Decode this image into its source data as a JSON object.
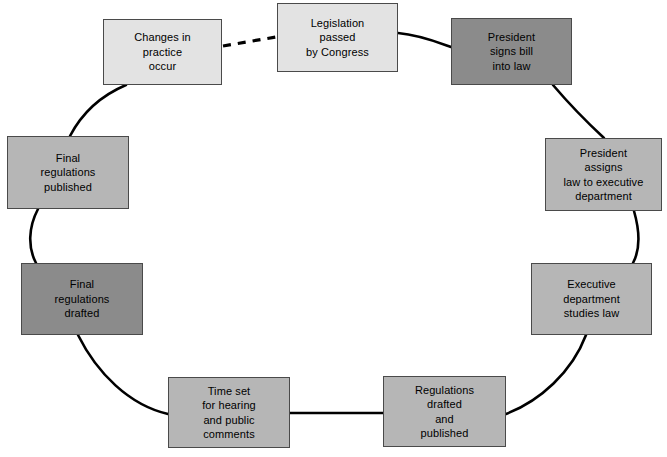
{
  "diagram": {
    "canvas": {
      "width": 667,
      "height": 457,
      "background": "#ffffff"
    },
    "palette": {
      "light": "#e3e3e3",
      "medium": "#b6b6b6",
      "dark": "#8b8b8b",
      "border": "#4a4a4a",
      "edge": "#000000",
      "text": "#000000"
    },
    "nodes": [
      {
        "id": "changes-in-practice-occur",
        "label": "Changes in\npractice\noccur",
        "tone": "light",
        "x": 103,
        "y": 19,
        "w": 119,
        "h": 66
      },
      {
        "id": "legislation-passed-by-congress",
        "label": "Legislation\npassed\nby Congress",
        "tone": "light",
        "x": 277,
        "y": 3,
        "w": 121,
        "h": 69
      },
      {
        "id": "president-signs-bill-into-law",
        "label": "President\nsigns bill\ninto law",
        "tone": "dark",
        "x": 451,
        "y": 18,
        "w": 121,
        "h": 67
      },
      {
        "id": "president-assigns-law-to-executive-department",
        "label": "President\nassigns\nlaw to executive\ndepartment",
        "tone": "medium",
        "x": 545,
        "y": 138,
        "w": 117,
        "h": 73
      },
      {
        "id": "executive-department-studies-law",
        "label": "Executive\ndepartment\nstudies law",
        "tone": "medium",
        "x": 531,
        "y": 263,
        "w": 121,
        "h": 72
      },
      {
        "id": "regulations-drafted-and-published",
        "label": "Regulations\ndrafted\nand\npublished",
        "tone": "medium",
        "x": 383,
        "y": 376,
        "w": 123,
        "h": 71
      },
      {
        "id": "time-set-for-hearing-and-public-comments",
        "label": "Time set\nfor hearing\nand public\ncomments",
        "tone": "medium",
        "x": 168,
        "y": 377,
        "w": 122,
        "h": 71
      },
      {
        "id": "final-regulations-drafted",
        "label": "Final\nregulations\ndrafted",
        "tone": "dark",
        "x": 21,
        "y": 263,
        "w": 122,
        "h": 72
      },
      {
        "id": "final-regulations-published",
        "label": "Final\nregulations\npublished",
        "tone": "medium",
        "x": 7,
        "y": 136,
        "w": 122,
        "h": 73
      }
    ],
    "edges": [
      {
        "id": "edge-changes-to-legislation",
        "from": "changes-in-practice-occur",
        "to": "legislation-passed-by-congress",
        "style": "dashed",
        "path": "M 223 46 L 276 37"
      },
      {
        "id": "edge-legislation-to-president-signs",
        "from": "legislation-passed-by-congress",
        "to": "president-signs-bill-into-law",
        "style": "solid",
        "path": "M 398 33 C 420 35 437 42 451 47"
      },
      {
        "id": "edge-president-signs-to-president-assigns",
        "from": "president-signs-bill-into-law",
        "to": "president-assigns-law-to-executive-department",
        "style": "solid",
        "path": "M 553 85 C 570 105 590 125 604 138"
      },
      {
        "id": "edge-president-assigns-to-executive-studies",
        "from": "president-assigns-law-to-executive-department",
        "to": "executive-department-studies-law",
        "style": "solid",
        "path": "M 634 211 C 640 232 640 250 633 263"
      },
      {
        "id": "edge-executive-studies-to-regulations",
        "from": "executive-department-studies-law",
        "to": "regulations-drafted-and-published",
        "style": "solid",
        "path": "M 586 335 C 572 372 540 401 506 414"
      },
      {
        "id": "edge-regulations-to-time-set",
        "from": "regulations-drafted-and-published",
        "to": "time-set-for-hearing-and-public-comments",
        "style": "solid",
        "path": "M 383 413 L 290 413"
      },
      {
        "id": "edge-time-set-to-final-drafted",
        "from": "time-set-for-hearing-and-public-comments",
        "to": "final-regulations-drafted",
        "style": "solid",
        "path": "M 168 414 C 129 405 97 373 78 335"
      },
      {
        "id": "edge-final-drafted-to-final-published",
        "from": "final-regulations-drafted",
        "to": "final-regulations-published",
        "style": "solid",
        "path": "M 36 263 C 28 248 28 228 38 209"
      },
      {
        "id": "edge-final-published-to-changes",
        "from": "final-regulations-published",
        "to": "changes-in-practice-occur",
        "style": "solid",
        "path": "M 70 136 C 82 113 100 96 126 85"
      }
    ]
  }
}
